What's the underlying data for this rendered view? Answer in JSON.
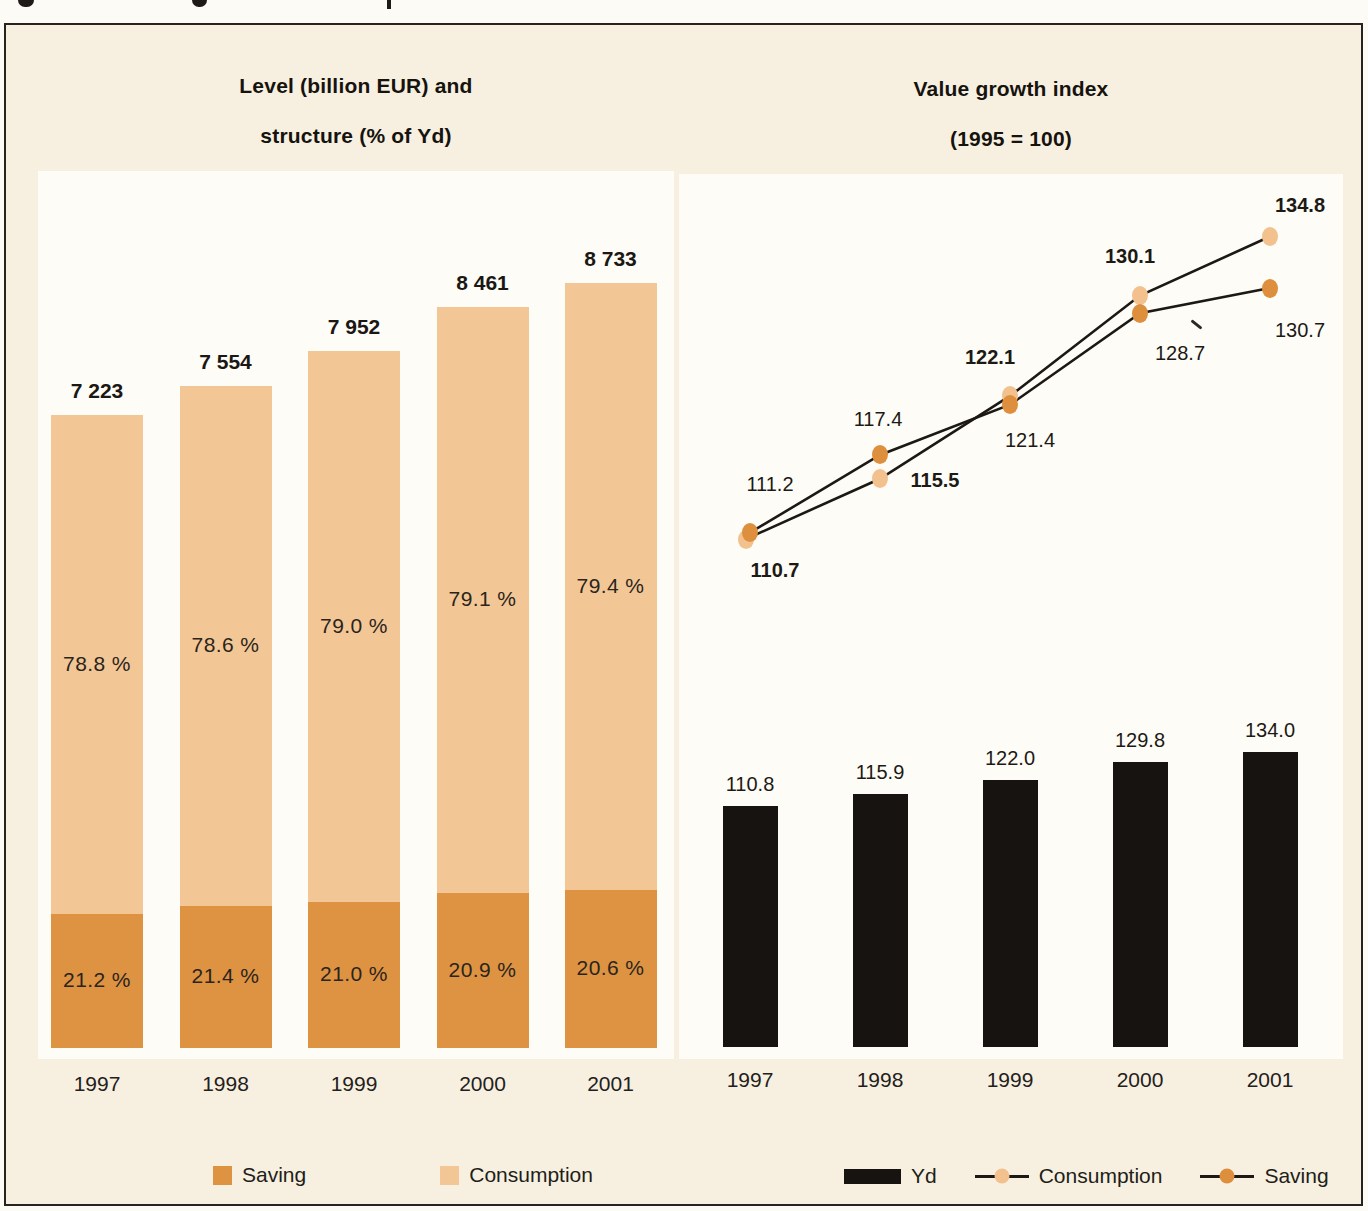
{
  "figure": {
    "background": "#f7f0e1",
    "plot_background": "#fdfcf7",
    "border_color": "#27241f"
  },
  "left_panel": {
    "title_line1": "Level (billion EUR) and",
    "title_line2": "structure (% of Yd)",
    "legend": [
      {
        "label": "Saving",
        "color": "#de9343"
      },
      {
        "label": "Consumption",
        "color": "#f3c795"
      }
    ]
  },
  "right_panel": {
    "title_line1": "Value growth index",
    "title_line2": "(1995 = 100)",
    "legend": [
      {
        "label": "Yd",
        "marker": "bar",
        "color": "#161310"
      },
      {
        "label": "Consumption",
        "marker": "line-dot",
        "color": "#f3c18e"
      },
      {
        "label": "Saving",
        "marker": "line-dot",
        "color": "#dd8f3e"
      }
    ]
  },
  "chart_data": [
    {
      "type": "bar",
      "subtype": "stacked",
      "title": "Level (billion EUR) and structure (% of Yd)",
      "categories": [
        "1997",
        "1998",
        "1999",
        "2000",
        "2001"
      ],
      "totals": [
        7223,
        7554,
        7952,
        8461,
        8733
      ],
      "total_labels": [
        "7 223",
        "7 554",
        "7 952",
        "8 461",
        "8 733"
      ],
      "ylim": [
        0,
        9000
      ],
      "grid": false,
      "legend_position": "bottom",
      "series": [
        {
          "name": "Consumption",
          "unit": "% of Yd",
          "values": [
            78.8,
            78.6,
            79.0,
            79.1,
            79.4
          ],
          "labels": [
            "78.8 %",
            "78.6 %",
            "79.0 %",
            "79.1 %",
            "79.4 %"
          ],
          "color": "#f3c795"
        },
        {
          "name": "Saving",
          "unit": "% of Yd",
          "values": [
            21.2,
            21.4,
            21.0,
            20.9,
            20.6
          ],
          "labels": [
            "21.2 %",
            "21.4 %",
            "21.0 %",
            "20.9 %",
            "20.6 %"
          ],
          "color": "#de9343"
        }
      ]
    },
    {
      "type": "line",
      "subtype": "line-and-bar",
      "title": "Value growth index (1995 = 100)",
      "categories": [
        "1997",
        "1998",
        "1999",
        "2000",
        "2001"
      ],
      "grid": false,
      "legend_position": "bottom",
      "series": [
        {
          "name": "Yd",
          "type": "bar",
          "values": [
            110.8,
            115.9,
            122.0,
            129.8,
            134.0
          ],
          "labels": [
            "110.8",
            "115.9",
            "122.0",
            "129.8",
            "134.0"
          ],
          "color": "#161310"
        },
        {
          "name": "Consumption",
          "type": "line",
          "values": [
            110.7,
            115.5,
            122.1,
            130.1,
            134.8
          ],
          "labels": [
            "110.7",
            "115.5",
            "122.1",
            "130.1",
            "134.8"
          ],
          "color": "#f3c18e",
          "label_style": "bold"
        },
        {
          "name": "Saving",
          "type": "line",
          "values": [
            111.2,
            117.4,
            121.4,
            128.7,
            130.7
          ],
          "labels": [
            "111.2",
            "117.4",
            "121.4",
            "128.7",
            "130.7"
          ],
          "color": "#dd8f3e",
          "label_style": "regular"
        }
      ]
    }
  ]
}
